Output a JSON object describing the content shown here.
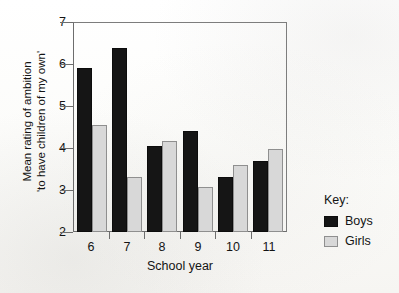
{
  "chart_data": {
    "type": "bar",
    "title": "",
    "xlabel": "School year",
    "ylabel": "Mean rating of ambition 'to have children of my own'",
    "ylabel_line1": "Mean rating of ambition",
    "ylabel_line2": "'to have children of my own'",
    "categories": [
      "6",
      "7",
      "8",
      "9",
      "10",
      "11"
    ],
    "ylim": [
      2,
      7
    ],
    "yticks": [
      "7",
      "6",
      "5",
      "4",
      "3",
      "2"
    ],
    "ytick_values": [
      7,
      6,
      5,
      4,
      3,
      2
    ],
    "grid": false,
    "legend_position": "right",
    "series": [
      {
        "name": "Boys",
        "color": "#151515",
        "values": [
          5.9,
          6.38,
          4.05,
          4.4,
          3.32,
          3.7
        ]
      },
      {
        "name": "Girls",
        "color": "#d8d8d8",
        "values": [
          4.55,
          3.3,
          4.17,
          3.08,
          3.6,
          3.97
        ]
      }
    ]
  },
  "legend": {
    "title": "Key:",
    "entries": [
      {
        "label": "Boys",
        "swatch": "boys"
      },
      {
        "label": "Girls",
        "swatch": "girls"
      }
    ]
  }
}
